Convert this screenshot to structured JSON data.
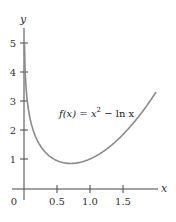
{
  "chart_data": {
    "type": "line",
    "title": "",
    "xlabel": "x",
    "ylabel": "y",
    "xlim": [
      -0.18,
      2.05
    ],
    "ylim": [
      -0.1,
      5.6
    ],
    "grid": false,
    "legend": null,
    "x_ticks": [
      {
        "value": 0,
        "label": "0"
      },
      {
        "value": 0.5,
        "label": "0.5"
      },
      {
        "value": 1.0,
        "label": "1.0"
      },
      {
        "value": 1.5,
        "label": "1.5"
      }
    ],
    "y_ticks": [
      {
        "value": 1,
        "label": "1"
      },
      {
        "value": 2,
        "label": "2"
      },
      {
        "value": 3,
        "label": "3"
      },
      {
        "value": 4,
        "label": "4"
      },
      {
        "value": 5,
        "label": "5"
      }
    ],
    "series": [
      {
        "name": "f(x) = x^2 - ln x",
        "color": "#8a8a8a",
        "x": [
          0.0067,
          0.01,
          0.02,
          0.05,
          0.1,
          0.2,
          0.3,
          0.4,
          0.5,
          0.6,
          0.707,
          0.8,
          0.9,
          1.0,
          1.1,
          1.2,
          1.3,
          1.4,
          1.5,
          1.6,
          1.7,
          1.8,
          1.9,
          2.0
        ],
        "values": [
          5.0,
          4.61,
          3.91,
          3.0,
          2.31,
          1.65,
          1.29,
          1.08,
          0.94,
          0.87,
          0.85,
          0.86,
          0.91,
          1.0,
          1.11,
          1.26,
          1.43,
          1.62,
          1.84,
          2.09,
          2.36,
          2.65,
          2.97,
          3.31
        ]
      }
    ],
    "annotations": [
      {
        "text_parts": [
          "f(x) = x",
          "2",
          " − ln x"
        ],
        "x": 0.55,
        "y": 2.4
      }
    ]
  },
  "labels": {
    "x_axis": "x",
    "y_axis": "y",
    "origin": "0",
    "fx_prefix": "f(x) = x",
    "fx_sup": "2",
    "fx_suffix": " − ln x"
  }
}
